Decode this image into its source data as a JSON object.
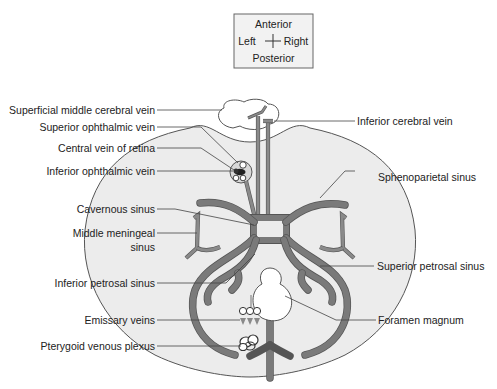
{
  "orientation": {
    "top": "Anterior",
    "left": "Left",
    "right": "Right",
    "bottom": "Posterior"
  },
  "labels_left": [
    {
      "id": "superficial-middle-cerebral-vein",
      "text": "Superficial middle cerebral vein"
    },
    {
      "id": "superior-ophthalmic-vein",
      "text": "Superior ophthalmic vein"
    },
    {
      "id": "central-vein-of-retina",
      "text": "Central vein of retina"
    },
    {
      "id": "inferior-ophthalmic-vein",
      "text": "Inferior ophthalmic vein"
    },
    {
      "id": "cavernous-sinus",
      "text": "Cavernous sinus"
    },
    {
      "id": "middle-meningeal-sinus",
      "text": "Middle meningeal",
      "text2": "sinus"
    },
    {
      "id": "inferior-petrosal-sinus",
      "text": "Inferior petrosal sinus"
    },
    {
      "id": "emissary-veins",
      "text": "Emissary veins"
    },
    {
      "id": "pterygoid-venous-plexus",
      "text": "Pterygoid venous plexus"
    }
  ],
  "labels_right": [
    {
      "id": "inferior-cerebral-vein",
      "text": "Inferior cerebral vein"
    },
    {
      "id": "sphenoparietal-sinus",
      "text": "Sphenoparietal sinus"
    },
    {
      "id": "superior-petrosal-sinus",
      "text": "Superior petrosal sinus"
    },
    {
      "id": "foramen-magnum",
      "text": "Foramen magnum"
    }
  ],
  "colors": {
    "skull_fill": "#ededed",
    "sinus": "#7a7a7a",
    "outline": "#555555",
    "text": "#222222"
  }
}
